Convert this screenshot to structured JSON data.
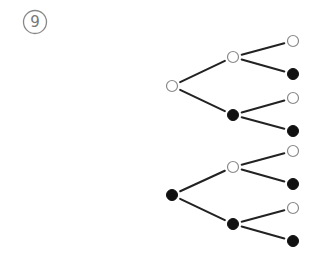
{
  "problem_label": "9",
  "colors": {
    "line": "#222222",
    "open_stroke": "#888888",
    "filled": "#111111",
    "background": "#ffffff"
  },
  "trees": [
    {
      "root": {
        "type": "open",
        "x": 172,
        "y": 86
      },
      "children": [
        {
          "type": "open",
          "x": 233,
          "y": 57,
          "children": [
            {
              "type": "open",
              "x": 293,
              "y": 41
            },
            {
              "type": "filled",
              "x": 293,
              "y": 74
            }
          ]
        },
        {
          "type": "filled",
          "x": 233,
          "y": 115,
          "children": [
            {
              "type": "open",
              "x": 293,
              "y": 98
            },
            {
              "type": "filled",
              "x": 293,
              "y": 131
            }
          ]
        }
      ]
    },
    {
      "root": {
        "type": "filled",
        "x": 172,
        "y": 195
      },
      "children": [
        {
          "type": "open",
          "x": 233,
          "y": 167,
          "children": [
            {
              "type": "open",
              "x": 293,
              "y": 151
            },
            {
              "type": "filled",
              "x": 293,
              "y": 184
            }
          ]
        },
        {
          "type": "filled",
          "x": 233,
          "y": 224,
          "children": [
            {
              "type": "open",
              "x": 293,
              "y": 208
            },
            {
              "type": "filled",
              "x": 293,
              "y": 241
            }
          ]
        }
      ]
    }
  ]
}
